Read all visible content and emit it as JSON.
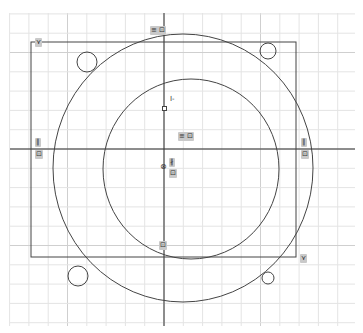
{
  "view": {
    "background": "#ffffff",
    "grid": {
      "color": "#e4e4e4",
      "major_color": "#cfcfcf",
      "spacing": 19.3,
      "x0": 10,
      "y0": 13,
      "x1": 355,
      "y1": 326
    },
    "axes": {
      "origin_x": 164,
      "origin_y": 149,
      "color": "#333333"
    }
  },
  "sketch": {
    "line_color": "#444444",
    "rectangle": {
      "x": 31,
      "y": 42,
      "w": 265,
      "h": 215
    },
    "outer_circle": {
      "cx": 183,
      "cy": 168,
      "rx": 130,
      "ry": 134
    },
    "inner_circle": {
      "cx": 191,
      "cy": 169,
      "rx": 88,
      "ry": 90
    },
    "holes": [
      {
        "name": "hole-top-left",
        "cx": 87,
        "cy": 62,
        "r": 10
      },
      {
        "name": "hole-top-right",
        "cx": 268,
        "cy": 51,
        "r": 8
      },
      {
        "name": "hole-bottom-left",
        "cx": 78,
        "cy": 276,
        "r": 10
      },
      {
        "name": "hole-bottom-right",
        "cx": 268,
        "cy": 278,
        "r": 6
      }
    ]
  },
  "constraints": {
    "top_tag": "≡ ⊡",
    "center_tag": "≡ ⊡",
    "left_parallel": "∥",
    "left_box": "⊡",
    "right_parallel": "∥",
    "right_box": "⊡",
    "center_vertical": "∦",
    "center_box": "⊡",
    "bottom_box": "⊡",
    "corner_top_left": "⋎",
    "corner_bottom_right": "⋎",
    "origin_marker": "⊗",
    "point_label": "I-"
  }
}
